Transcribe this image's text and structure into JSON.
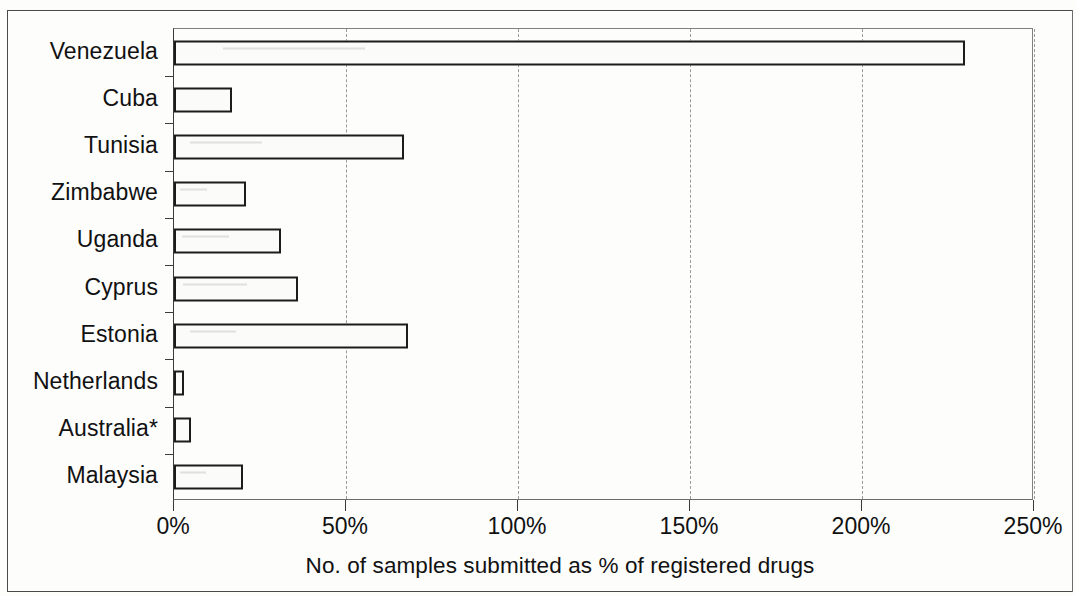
{
  "chart_data": {
    "type": "bar",
    "orientation": "horizontal",
    "title": "",
    "xlabel": "No. of samples submitted as % of registered drugs",
    "ylabel": "",
    "categories": [
      "Venezuela",
      "Cuba",
      "Tunisia",
      "Zimbabwe",
      "Uganda",
      "Cyprus",
      "Estonia",
      "Netherlands",
      "Australia*",
      "Malaysia"
    ],
    "values": [
      230,
      17,
      67,
      21,
      31,
      36,
      68,
      3,
      5,
      20
    ],
    "value_unit": "%",
    "xlim": [
      0,
      250
    ],
    "xticks": [
      0,
      50,
      100,
      150,
      200,
      250
    ],
    "xtick_labels": [
      "0%",
      "50%",
      "100%",
      "150%",
      "200%",
      "250%"
    ],
    "grid": "vertical-dashed",
    "legend": "none",
    "bar_fill": "#fbfbfa",
    "bar_edge": "#1c1c1c",
    "axis_color": "#3a3a3a",
    "grid_color": "#9a9a9a"
  }
}
